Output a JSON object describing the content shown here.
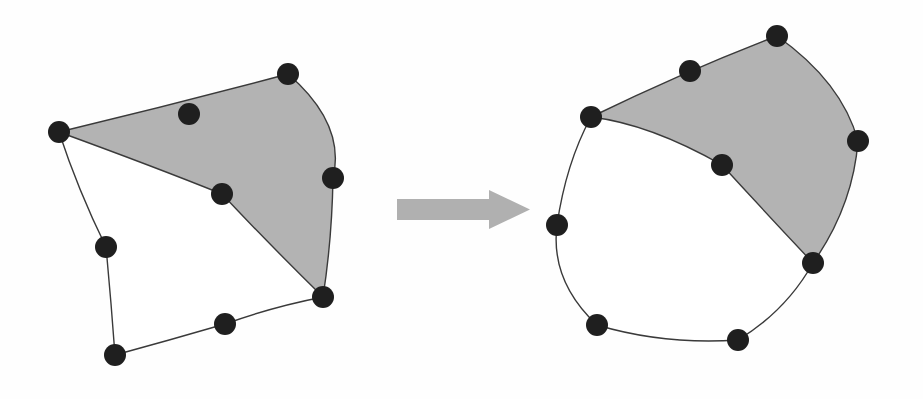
{
  "figure": {
    "name": "quadrilateral-element-transformation",
    "background_color": "#fefefe",
    "node_color": "#1f1f1f",
    "node_radius": 11,
    "shaded_fill": "#b3b3b3",
    "unshaded_fill": "#ffffff",
    "edge_color": "#3a3a3a",
    "edge_width": 1.4,
    "arrow_color": "#b0b0b0",
    "ghost_artifact_1": "elemento",
    "ghost_artifact_2": "elementos solido"
  },
  "arrow": {
    "name": "transformation-arrow",
    "direction": "right",
    "x_start": 397,
    "x_tip": 530,
    "shaft_top": 199,
    "shaft_bottom": 220,
    "head_top": 190,
    "head_bottom": 229,
    "head_base_x": 489,
    "color": "#b0b0b0"
  },
  "shapes": [
    {
      "id": "left-element",
      "label": "Initial element",
      "nodes": [
        {
          "id": "L1",
          "role": "corner",
          "x": 59,
          "y": 132
        },
        {
          "id": "L2",
          "role": "midside",
          "x": 189,
          "y": 114
        },
        {
          "id": "L3",
          "role": "corner",
          "x": 288,
          "y": 74
        },
        {
          "id": "L4",
          "role": "midside",
          "x": 333,
          "y": 178
        },
        {
          "id": "L5",
          "role": "corner",
          "x": 323,
          "y": 297
        },
        {
          "id": "L6",
          "role": "midside",
          "x": 225,
          "y": 324
        },
        {
          "id": "L7",
          "role": "corner",
          "x": 115,
          "y": 355
        },
        {
          "id": "L8",
          "role": "midside",
          "x": 106,
          "y": 247
        },
        {
          "id": "L9",
          "role": "center",
          "x": 222,
          "y": 194
        }
      ],
      "shaded_region_path": "M 59 132 Q 175 104 288 74 Q 346 124 333 178 Q 332 239 323 297 Q 268 243 222 194 Q 155 167 59 132 Z",
      "unshaded_region_path": "M 59 132 Q 155 167 222 194 Q 268 243 323 297 Q 272 307 225 324 Q 170 340 115 355 Q 111 300 106 247 Q 78 190 59 132 Z",
      "outline_path": "M 59 132 Q 175 104 288 74 Q 346 124 333 178 Q 332 239 323 297 Q 272 307 225 324 Q 170 340 115 355 Q 111 300 106 247 Q 78 190 59 132 Z",
      "interior_path": "M 59 132 Q 155 167 222 194 Q 268 243 323 297"
    },
    {
      "id": "right-element",
      "label": "Deformed element",
      "nodes": [
        {
          "id": "R1",
          "role": "corner",
          "x": 591,
          "y": 117
        },
        {
          "id": "R2",
          "role": "midside",
          "x": 690,
          "y": 71
        },
        {
          "id": "R3",
          "role": "corner",
          "x": 777,
          "y": 36
        },
        {
          "id": "R4",
          "role": "midside",
          "x": 858,
          "y": 141
        },
        {
          "id": "R5",
          "role": "corner",
          "x": 813,
          "y": 263
        },
        {
          "id": "R6",
          "role": "midside",
          "x": 738,
          "y": 340
        },
        {
          "id": "R7",
          "role": "corner",
          "x": 597,
          "y": 325
        },
        {
          "id": "R8",
          "role": "midside",
          "x": 557,
          "y": 225
        },
        {
          "id": "R9",
          "role": "center",
          "x": 722,
          "y": 165
        }
      ],
      "shaded_region_path": "M 591 117 Q 688 70 777 36 Q 842 82 858 141 Q 853 206 813 263 Q 765 212 722 165 Q 650 124 591 117 Z",
      "unshaded_region_path": "M 591 117 Q 650 124 722 165 Q 765 212 813 263 Q 786 311 738 340 Q 664 345 597 325 Q 550 281 557 225 Q 566 163 591 117 Z",
      "outline_path": "M 591 117 Q 688 70 777 36 Q 842 82 858 141 Q 853 206 813 263 Q 786 311 738 340 Q 664 345 597 325 Q 550 281 557 225 Q 566 163 591 117 Z",
      "interior_path": "M 591 117 Q 650 124 722 165 Q 765 212 813 263"
    }
  ]
}
